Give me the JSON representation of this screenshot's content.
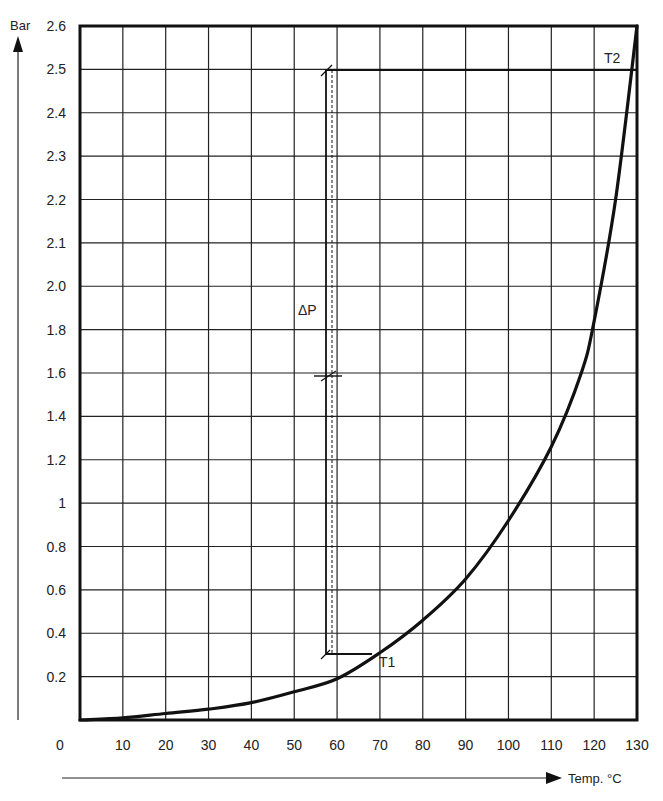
{
  "chart_data": {
    "type": "line",
    "title": "",
    "xlabel": "Temp. °C",
    "ylabel": "Bar",
    "xlim": [
      0,
      130
    ],
    "ylim": [
      0,
      2.6
    ],
    "grid": true,
    "legend": null,
    "x_ticks": [
      "0",
      "10",
      "20",
      "30",
      "40",
      "50",
      "60",
      "70",
      "80",
      "90",
      "100",
      "110",
      "120",
      "130"
    ],
    "y_ticks": [
      "0.2",
      "0.4",
      "0.6",
      "0.8",
      "1",
      "1.2",
      "1.4",
      "1.6",
      "1.8",
      "2.0",
      "2.1",
      "2.2",
      "2.3",
      "2.4",
      "2.5",
      "2.6"
    ],
    "axis_note": "Y axis is non-linear: 0.2 steps from 0 to 2.0, then 0.1 steps from 2.0 to 2.6 (equal grid spacing)",
    "series": [
      {
        "name": "Vapour pressure curve",
        "x": [
          0,
          10,
          20,
          30,
          40,
          50,
          60,
          70,
          80,
          90,
          100,
          110,
          117,
          120,
          125,
          130
        ],
        "y": [
          0.0,
          0.01,
          0.03,
          0.05,
          0.08,
          0.13,
          0.19,
          0.31,
          0.46,
          0.65,
          0.92,
          1.26,
          1.6,
          1.84,
          2.2,
          2.6
        ]
      }
    ],
    "annotations": [
      {
        "text": "T1",
        "x": 70,
        "y": 0.31
      },
      {
        "text": "T2",
        "x": 128,
        "y": 2.5
      },
      {
        "text": "ΔP",
        "x": 58,
        "y": 1.9,
        "note": "vertical bracket from 0.31 bar to 2.5 bar at x≈58°C"
      }
    ]
  },
  "labels": {
    "y_axis": "Bar",
    "x_axis": "Temp. °C",
    "t1": "T1",
    "t2": "T2",
    "delta_p": "ΔP"
  },
  "colors": {
    "ink": "#1a1a1a",
    "background": "#ffffff"
  }
}
